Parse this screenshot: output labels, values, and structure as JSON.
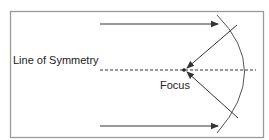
{
  "diagram": {
    "type": "parabolic-mirror-reflection",
    "labels": {
      "line_of_symmetry": "Line of Symmetry",
      "focus": "Focus"
    },
    "colors": {
      "border": "#9a9a9a",
      "lines": "#333333",
      "background": "#ffffff"
    },
    "elements": {
      "frame": {
        "x": 10,
        "y": 11,
        "width": 253,
        "height": 126
      },
      "incoming_rays": [
        {
          "from": [
            100,
            24
          ],
          "to": [
            218,
            24
          ]
        },
        {
          "from": [
            100,
            126
          ],
          "to": [
            218,
            126
          ]
        }
      ],
      "reflected_rays": [
        {
          "from": [
            237,
            25
          ],
          "to": [
            186,
            69
          ]
        },
        {
          "from": [
            238,
            118
          ],
          "to": [
            186,
            71
          ]
        }
      ],
      "symmetry_axis": {
        "from": [
          100,
          70
        ],
        "to": [
          256,
          70
        ],
        "style": "dashed"
      },
      "mirror_arc": {
        "top": [
          217,
          15
        ],
        "vertex": [
          256,
          70
        ],
        "bottom": [
          217,
          133
        ]
      },
      "focus_point": [
        184,
        70
      ]
    }
  }
}
